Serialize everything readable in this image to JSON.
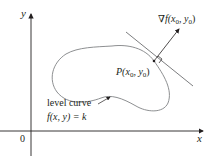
{
  "figure": {
    "axes": {
      "x_label": "x",
      "y_label": "y",
      "origin_label": "0"
    },
    "gradient_label": {
      "nabla": "∇",
      "f": "f",
      "args": "(x",
      "sub0a": "0",
      "comma": ", y",
      "sub0b": "0",
      "close": ")"
    },
    "point_label": {
      "P": "P",
      "args": "(x",
      "sub0a": "0",
      "comma": ", y",
      "sub0b": "0",
      "close": ")"
    },
    "level_curve_label": "level curve",
    "equation": {
      "f": "f",
      "args": "(x, y) = ",
      "k": "k"
    },
    "colors": {
      "axes": "#231f20",
      "curve": "#6d6e71",
      "text": "#231f20"
    }
  }
}
